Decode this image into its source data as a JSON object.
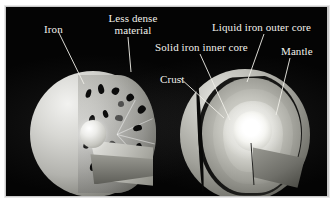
{
  "figure": {
    "background_color": "#040404",
    "frame_color": "#c9c9c9",
    "label_color": "#f2f1ec",
    "leader_line_color": "#f0efe9"
  },
  "labels": [
    {
      "id": "iron",
      "text": "Iron",
      "x": 44,
      "y": 24,
      "align": "left"
    },
    {
      "id": "less-dense-material",
      "text": "Less dense material",
      "x": 106,
      "y": 13,
      "align": "center",
      "lines": [
        "Less dense",
        "material"
      ]
    },
    {
      "id": "solid-iron-inner-core",
      "text": "Solid iron inner core",
      "x": 155,
      "y": 42,
      "align": "left"
    },
    {
      "id": "liquid-iron-outer-core",
      "text": "Liquid iron outer core",
      "x": 212,
      "y": 22,
      "align": "left"
    },
    {
      "id": "mantle",
      "text": "Mantle",
      "x": 281,
      "y": 46,
      "align": "left"
    },
    {
      "id": "crust",
      "text": "Crust",
      "x": 160,
      "y": 74,
      "align": "left"
    }
  ],
  "leaders": [
    {
      "id": "leader-iron",
      "x1": 58,
      "y1": 31,
      "x2": 84,
      "y2": 84
    },
    {
      "id": "leader-less-dense",
      "x1": 128,
      "y1": 37,
      "x2": 131,
      "y2": 72
    },
    {
      "id": "leader-solid-inner-core",
      "x1": 200,
      "y1": 54,
      "x2": 230,
      "y2": 120
    },
    {
      "id": "leader-liquid-outer-core",
      "x1": 264,
      "y1": 34,
      "x2": 247,
      "y2": 82
    },
    {
      "id": "leader-mantle",
      "x1": 290,
      "y1": 58,
      "x2": 276,
      "y2": 115
    },
    {
      "id": "leader-crust",
      "x1": 180,
      "y1": 78,
      "x2": 224,
      "y2": 118
    }
  ],
  "diagrams": [
    {
      "id": "left-globe",
      "name": "differentiating-planet",
      "description": "Cutaway of a differentiating planet: dense iron droplets sinking through less dense material toward a forming core.",
      "features": [
        "iron droplets",
        "less dense material",
        "forming core"
      ]
    },
    {
      "id": "right-globe",
      "name": "layered-earth",
      "description": "Cutaway of the differentiated Earth showing crust, mantle, liquid iron outer core and solid iron inner core.",
      "features": [
        "crust",
        "mantle",
        "liquid iron outer core",
        "solid iron inner core"
      ]
    }
  ]
}
